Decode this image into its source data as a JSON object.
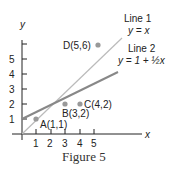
{
  "figure": {
    "caption": "Figure 5",
    "x_axis_label": "x",
    "y_axis_label": "y",
    "x_ticks": [
      "1",
      "2",
      "3",
      "4",
      "5"
    ],
    "y_ticks": [
      "1",
      "2",
      "3",
      "4",
      "5"
    ],
    "points": [
      {
        "label": "A(1,1)",
        "x": 1,
        "y": 1
      },
      {
        "label": "B(3,2)",
        "x": 3,
        "y": 2
      },
      {
        "label": "C(4,2)",
        "x": 4,
        "y": 2
      },
      {
        "label": "D(5,6)",
        "x": 5,
        "y": 6
      }
    ],
    "lines": [
      {
        "name": "Line 1",
        "equation": "y = x"
      },
      {
        "name": "Line 2",
        "equation": "y = 1 + ½x"
      }
    ],
    "colors": {
      "axis": "#222222",
      "line1": "#bbbbbb",
      "line2": "#888888",
      "point": "#999999"
    }
  }
}
